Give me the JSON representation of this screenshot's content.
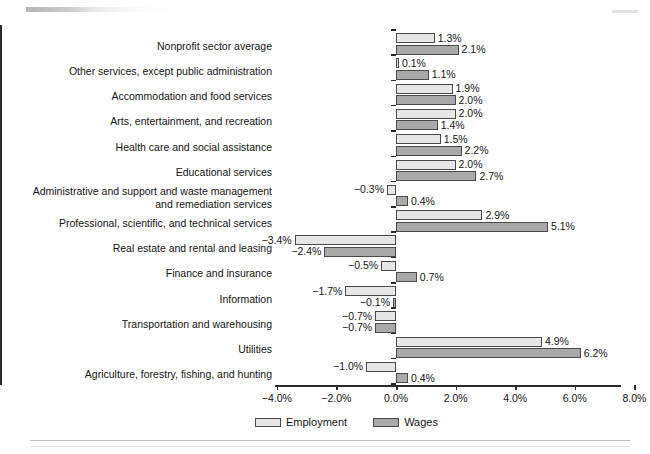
{
  "chart_data": {
    "type": "bar",
    "orientation": "horizontal",
    "title": "",
    "xlabel": "",
    "ylabel": "",
    "xlim": [
      -4.0,
      8.0
    ],
    "xticks": [
      -4.0,
      -2.0,
      0.0,
      2.0,
      4.0,
      6.0,
      8.0
    ],
    "xtick_labels": [
      "−4.0%",
      "−2.0%",
      "0.0%",
      "2.0%",
      "4.0%",
      "6.0%",
      "8.0%"
    ],
    "grid": false,
    "legend_position": "bottom-left",
    "value_suffix": "%",
    "categories": [
      "Nonprofit sector average",
      "Other services, except public administration",
      "Accommodation and food services",
      "Arts, entertainment, and recreation",
      "Health care and social assistance",
      "Educational services",
      "Administrative and support and waste management\nand remediation services",
      "Professional, scientific, and technical services",
      "Real estate and rental and leasing",
      "Finance and insurance",
      "Information",
      "Transportation and warehousing",
      "Utilities",
      "Agriculture, forestry, fishing, and hunting"
    ],
    "series": [
      {
        "name": "Employment",
        "color": "#e6e6e6",
        "values": [
          1.3,
          0.1,
          1.9,
          2.0,
          1.5,
          2.0,
          -0.3,
          2.9,
          -3.4,
          -0.5,
          -1.7,
          -0.7,
          4.9,
          -1.0
        ],
        "labels": [
          "1.3%",
          "0.1%",
          "1.9%",
          "2.0%",
          "1.5%",
          "2.0%",
          "−0.3%",
          "2.9%",
          "−3.4%",
          "−0.5%",
          "−1.7%",
          "−0.7%",
          "4.9%",
          "−1.0%"
        ]
      },
      {
        "name": "Wages",
        "color": "#a9a9a9",
        "values": [
          2.1,
          1.1,
          2.0,
          1.4,
          2.2,
          2.7,
          0.4,
          5.1,
          -2.4,
          0.7,
          -0.1,
          -0.7,
          6.2,
          0.4
        ],
        "labels": [
          "2.1%",
          "1.1%",
          "2.0%",
          "1.4%",
          "2.2%",
          "2.7%",
          "0.4%",
          "5.1%",
          "−2.4%",
          "0.7%",
          "−0.1%",
          "−0.7%",
          "6.2%",
          "0.4%"
        ]
      }
    ]
  },
  "legend": {
    "items": [
      {
        "label": "Employment",
        "swatch": "employment"
      },
      {
        "label": "Wages",
        "swatch": "wages"
      }
    ]
  }
}
